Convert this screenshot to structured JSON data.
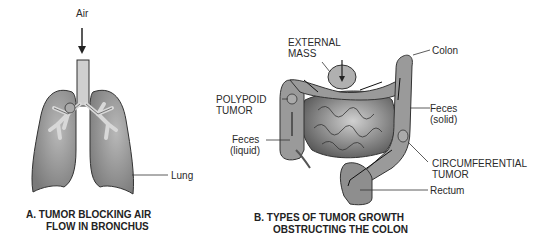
{
  "panel_a": {
    "labels": {
      "air": "Air",
      "lung": "Lung"
    },
    "caption_line1": "A. TUMOR BLOCKING AIR",
    "caption_line2": "FLOW IN BRONCHUS"
  },
  "panel_b": {
    "labels": {
      "external_mass_line1": "EXTERNAL",
      "external_mass_line2": "MASS",
      "colon": "Colon",
      "polypoid_line1": "POLYPOID",
      "polypoid_line2": "TUMOR",
      "feces_solid_line1": "Feces",
      "feces_solid_line2": "(solid)",
      "feces_liquid_line1": "Feces",
      "feces_liquid_line2": "(liquid)",
      "circumferential_line1": "CIRCUMFERENTIAL",
      "circumferential_line2": "TUMOR",
      "rectum": "Rectum"
    },
    "caption_line1": "B. TYPES OF TUMOR GROWTH",
    "caption_line2": "OBSTRUCTING THE COLON"
  },
  "colors": {
    "lung_fill": "#8a8a8a",
    "bronchus_fill": "#cfcfcf",
    "colon_fill": "#9a9a9a",
    "intestine_fill": "#6e6e6e",
    "line": "#333333"
  }
}
